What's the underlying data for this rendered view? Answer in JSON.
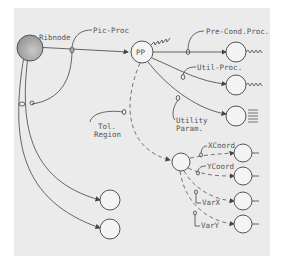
{
  "diagram": {
    "root": "Ribnode",
    "center": "PP",
    "labels": {
      "pic_proc": "Pic-Proc",
      "pre_cond_proc": "Pre-Cond.Proc.",
      "util_proc": "Util-Proc.",
      "utility_param_1": "Utility",
      "utility_param_2": "Param.",
      "tol_region_1": "Tol.",
      "tol_region_2": "Region",
      "xcoord": "XCoord",
      "ycoord": "YCoord",
      "varx": "VarX",
      "vary": "VarY"
    },
    "colors": {
      "paper": "#ebebeb",
      "ink": "#555555",
      "root_fill": "#a8a8a8"
    }
  }
}
